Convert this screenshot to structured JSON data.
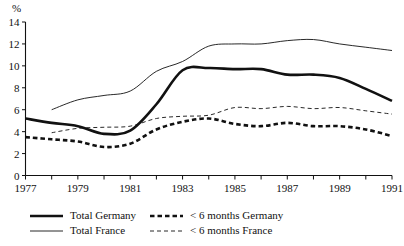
{
  "chart_data": {
    "type": "line",
    "title": "",
    "subtitle": "",
    "xlabel": "",
    "ylabel": "%",
    "ylim": [
      0,
      14
    ],
    "xlim": [
      1977,
      1991
    ],
    "grid": false,
    "legend_position": "bottom-left",
    "y_ticks": [
      0,
      2,
      4,
      6,
      8,
      10,
      12,
      14
    ],
    "y_tick_labels": [
      "0",
      "2",
      "4",
      "6",
      "8",
      "10",
      "12",
      "14"
    ],
    "x_ticks": [
      1977,
      1978,
      1979,
      1980,
      1981,
      1982,
      1983,
      1984,
      1985,
      1986,
      1987,
      1988,
      1989,
      1990,
      1991
    ],
    "x_tick_labels": [
      "1977",
      "",
      "1979",
      "",
      "1981",
      "",
      "1983",
      "",
      "1985",
      "",
      "1987",
      "",
      "1989",
      "",
      "1991"
    ],
    "x_labeled_ticks": [
      "1977",
      "1979",
      "1981",
      "1983",
      "1985",
      "1987",
      "1989",
      "1991"
    ],
    "x": [
      1977,
      1978,
      1979,
      1980,
      1981,
      1982,
      1983,
      1984,
      1985,
      1986,
      1987,
      1988,
      1989,
      1990,
      1991
    ],
    "series": [
      {
        "name": "Total Germany",
        "style": "thick-solid",
        "color": "#111111",
        "x": [
          1977,
          1978,
          1979,
          1980,
          1981,
          1982,
          1983,
          1984,
          1985,
          1986,
          1987,
          1988,
          1989,
          1990,
          1991
        ],
        "values": [
          5.2,
          4.8,
          4.5,
          3.8,
          4.1,
          6.5,
          9.6,
          9.8,
          9.7,
          9.7,
          9.2,
          9.2,
          8.9,
          7.9,
          6.8
        ]
      },
      {
        "name": "Total France",
        "style": "thin-solid",
        "color": "#111111",
        "x": [
          1978,
          1979,
          1980,
          1981,
          1982,
          1983,
          1984,
          1985,
          1986,
          1987,
          1988,
          1989,
          1990,
          1991
        ],
        "values": [
          6.0,
          6.9,
          7.3,
          7.7,
          9.5,
          10.4,
          11.8,
          12.0,
          12.0,
          12.3,
          12.4,
          12.0,
          11.7,
          11.4
        ]
      },
      {
        "name": "< 6 months Germany",
        "style": "thick-dashed",
        "color": "#111111",
        "x": [
          1977,
          1978,
          1979,
          1980,
          1981,
          1982,
          1983,
          1984,
          1985,
          1986,
          1987,
          1988,
          1989,
          1990,
          1991
        ],
        "values": [
          3.5,
          3.3,
          3.1,
          2.6,
          2.9,
          4.2,
          4.9,
          5.2,
          4.7,
          4.5,
          4.8,
          4.5,
          4.5,
          4.2,
          3.6
        ]
      },
      {
        "name": "< 6 months France",
        "style": "thin-dashed",
        "color": "#111111",
        "x": [
          1978,
          1979,
          1980,
          1981,
          1982,
          1983,
          1984,
          1985,
          1986,
          1987,
          1988,
          1989,
          1990,
          1991
        ],
        "values": [
          3.9,
          4.3,
          4.4,
          4.5,
          5.2,
          5.4,
          5.5,
          6.2,
          6.1,
          6.3,
          6.1,
          6.2,
          5.9,
          5.6
        ]
      }
    ],
    "legend": [
      {
        "label": "Total Germany",
        "style": "thick-solid"
      },
      {
        "label": "< 6 months Germany",
        "style": "thick-dashed"
      },
      {
        "label": "Total France",
        "style": "thin-solid"
      },
      {
        "label": "< 6 months France",
        "style": "thin-dashed"
      }
    ]
  }
}
